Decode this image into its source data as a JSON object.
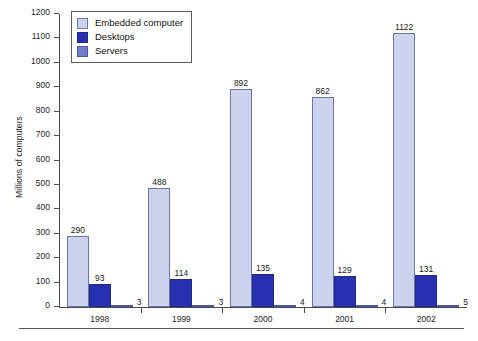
{
  "chart_data": {
    "type": "bar",
    "title": "",
    "subtitle": "",
    "xlabel": "",
    "ylabel": "Millions of computers",
    "categories": [
      "1998",
      "1999",
      "2000",
      "2001",
      "2002"
    ],
    "series": [
      {
        "name": "Embedded computer",
        "color": "#ccd3ee",
        "values": [
          290,
          488,
          892,
          862,
          1122
        ]
      },
      {
        "name": "Desktops",
        "color": "#2630b0",
        "values": [
          93,
          114,
          135,
          129,
          131
        ]
      },
      {
        "name": "Servers",
        "color": "#6f7fcd",
        "values": [
          3,
          3,
          4,
          4,
          5
        ]
      }
    ],
    "ylim": [
      0,
      1200
    ],
    "ytick_step": 100,
    "yticks": [
      0,
      100,
      200,
      300,
      400,
      500,
      600,
      700,
      800,
      900,
      1000,
      1100,
      1200
    ],
    "ytick_labels": [
      "0",
      "100",
      "200",
      "300",
      "400",
      "500",
      "600",
      "700",
      "800",
      "900",
      "1000",
      "1100",
      "1200"
    ],
    "grid": false,
    "legend_position": "upper-left",
    "data_labels": true,
    "bar_value_labels": [
      [
        "290",
        "93",
        "3"
      ],
      [
        "488",
        "114",
        "3"
      ],
      [
        "892",
        "135",
        "4"
      ],
      [
        "862",
        "129",
        "4"
      ],
      [
        "1122",
        "131",
        "5"
      ]
    ]
  },
  "legend": {
    "items": [
      {
        "label": "Embedded computer",
        "color": "#ccd3ee"
      },
      {
        "label": "Desktops",
        "color": "#2630b0"
      },
      {
        "label": "Servers",
        "color": "#6f7fcd"
      }
    ]
  }
}
